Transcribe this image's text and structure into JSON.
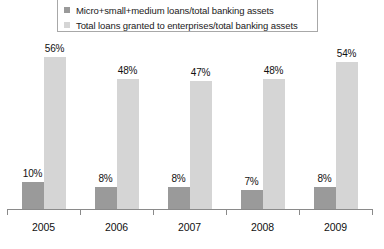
{
  "chart_data": {
    "type": "bar",
    "title": "",
    "xlabel": "",
    "ylabel": "",
    "grid": false,
    "legend_position": "top",
    "ylim": [
      0,
      60
    ],
    "categories": [
      "2005",
      "2006",
      "2007",
      "2008",
      "2009"
    ],
    "series": [
      {
        "name": "Micro+small+medium loans/total banking assets",
        "color": "#9a9a9a",
        "values": [
          10,
          8,
          8,
          7,
          8
        ],
        "labels": [
          "10%",
          "8%",
          "8%",
          "7%",
          "8%"
        ]
      },
      {
        "name": "Total loans granted to enterprises/total banking assets",
        "color": "#d5d5d5",
        "values": [
          56,
          48,
          47,
          48,
          54
        ],
        "labels": [
          "56%",
          "48%",
          "47%",
          "48%",
          "54%"
        ]
      }
    ]
  },
  "legend": {
    "items": [
      {
        "label": "Micro+small+medium loans/total banking assets",
        "color": "#9a9a9a"
      },
      {
        "label": "Total loans granted to enterprises/total banking assets",
        "color": "#d5d5d5"
      }
    ]
  },
  "axis": {
    "categories": [
      "2005",
      "2006",
      "2007",
      "2008",
      "2009"
    ]
  }
}
